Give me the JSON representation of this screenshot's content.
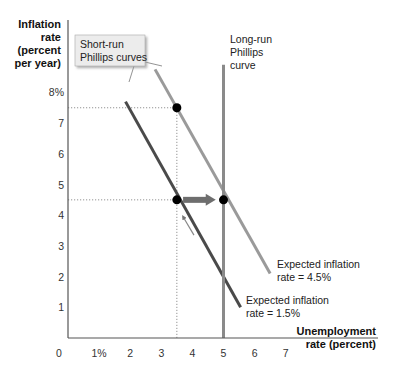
{
  "chart_data": {
    "type": "line",
    "title": "",
    "ylabel": [
      "Inflation",
      "rate",
      "(percent",
      "per year)"
    ],
    "xlabel": [
      "Unemployment",
      "rate (percent)"
    ],
    "xlim": [
      0,
      8
    ],
    "ylim": [
      0,
      8.5
    ],
    "x_ticks": [
      {
        "value": 0,
        "label": "0"
      },
      {
        "value": 1,
        "label": "1%"
      },
      {
        "value": 2,
        "label": "2"
      },
      {
        "value": 3,
        "label": "3"
      },
      {
        "value": 4,
        "label": "4"
      },
      {
        "value": 5,
        "label": "5"
      },
      {
        "value": 6,
        "label": "6"
      },
      {
        "value": 7,
        "label": "7"
      }
    ],
    "y_ticks": [
      {
        "value": 1,
        "label": "1"
      },
      {
        "value": 2,
        "label": "2"
      },
      {
        "value": 3,
        "label": "3"
      },
      {
        "value": 4,
        "label": "4"
      },
      {
        "value": 5,
        "label": "5"
      },
      {
        "value": 6,
        "label": "6"
      },
      {
        "value": 7,
        "label": "7"
      },
      {
        "value": 8,
        "label": "8%"
      }
    ],
    "grid": false,
    "series": [
      {
        "name": "Short-run Phillips curve (expected inflation 1.5%)",
        "color": "#4a4a4a",
        "x": [
          1.85,
          5.55
        ],
        "y": [
          7.7,
          1.0
        ],
        "label": [
          "Expected inflation",
          "rate = 1.5%"
        ]
      },
      {
        "name": "Short-run Phillips curve (expected inflation 4.5%)",
        "color": "#9a9a9a",
        "x": [
          2.8,
          6.5
        ],
        "y": [
          8.75,
          2.1
        ],
        "label": [
          "Expected inflation",
          "rate = 4.5%"
        ]
      },
      {
        "name": "Long-run Phillips curve",
        "color": "#8a8a8a",
        "x": [
          5,
          5
        ],
        "y": [
          0,
          8.9
        ],
        "label": [
          "Long-run",
          "Phillips",
          "curve"
        ]
      }
    ],
    "points": [
      {
        "x": 3.5,
        "y": 7.5
      },
      {
        "x": 3.5,
        "y": 4.5
      },
      {
        "x": 5,
        "y": 4.5
      }
    ],
    "reference_lines": [
      {
        "from": [
          0,
          7.5
        ],
        "to": [
          3.5,
          7.5
        ]
      },
      {
        "from": [
          0,
          4.5
        ],
        "to": [
          3.5,
          4.5
        ]
      },
      {
        "from": [
          3.5,
          0
        ],
        "to": [
          3.5,
          7.5
        ]
      }
    ],
    "arrows": [
      {
        "from": [
          3.7,
          4.5
        ],
        "to": [
          4.75,
          4.5
        ],
        "style": "thick"
      },
      {
        "from": [
          4.05,
          3.35
        ],
        "to": [
          3.7,
          3.95
        ],
        "style": "thin"
      }
    ],
    "callout": {
      "text": [
        "Short-run",
        "Phillips curves"
      ],
      "fill": "#ececec"
    }
  }
}
